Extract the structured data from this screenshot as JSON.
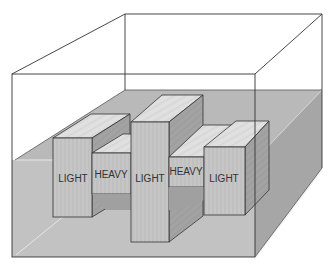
{
  "figure": {
    "colors": {
      "background": "#ffffff",
      "water": "#bdbdbd",
      "water_side": "#a8a8a8",
      "block_front": "#c4c4c4",
      "block_top": "#e2e2e2",
      "block_side": "#9c9c9c",
      "outline": "#333333"
    },
    "blocks": [
      {
        "label": "LIGHT",
        "type": "light"
      },
      {
        "label": "HEAVY",
        "type": "heavy"
      },
      {
        "label": "LIGHT",
        "type": "light"
      },
      {
        "label": "HEAVY",
        "type": "heavy"
      },
      {
        "label": "LIGHT",
        "type": "light"
      }
    ]
  }
}
